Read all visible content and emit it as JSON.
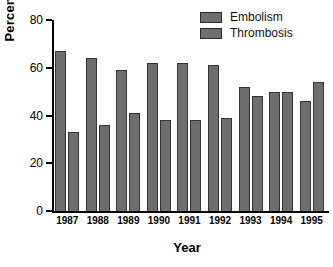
{
  "chart_data": {
    "type": "bar",
    "title": "",
    "xlabel": "Year",
    "ylabel": "Percent",
    "categories": [
      "1987",
      "1988",
      "1989",
      "1990",
      "1991",
      "1992",
      "1993",
      "1994",
      "1995"
    ],
    "series": [
      {
        "name": "Embolism",
        "values": [
          67,
          64,
          59,
          62,
          62,
          61,
          52,
          50,
          46
        ],
        "color": "#6e6e6e"
      },
      {
        "name": "Thrombosis",
        "values": [
          33,
          36,
          41,
          38,
          38,
          39,
          48,
          50,
          54
        ],
        "color": "#6e6e6e"
      }
    ],
    "ylim": [
      0,
      80
    ],
    "yticks": [
      0,
      20,
      40,
      60,
      80
    ],
    "ytick_labels": [
      "0",
      "20",
      "40",
      "60",
      "80"
    ],
    "grid": false,
    "legend_position": "top-right"
  },
  "legend": {
    "entries": [
      {
        "label": "Embolism"
      },
      {
        "label": "Thrombosis"
      }
    ]
  },
  "axes": {
    "y_title": "Percent",
    "x_title": "Year"
  }
}
